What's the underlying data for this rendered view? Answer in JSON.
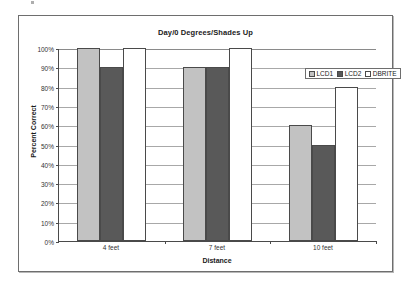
{
  "chart_data": {
    "type": "bar",
    "title": "Day/0 Degrees/Shades Up",
    "xlabel": "Distance",
    "ylabel": "Percent Correct",
    "categories": [
      "4 feet",
      "7 feet",
      "10 feet"
    ],
    "series": [
      {
        "name": "LCD1",
        "color": "#c2c2c2",
        "values": [
          100,
          90,
          60
        ]
      },
      {
        "name": "LCD2",
        "color": "#595959",
        "values": [
          90,
          90,
          50
        ]
      },
      {
        "name": "DBRITE",
        "color": "#ffffff",
        "values": [
          100,
          100,
          80
        ]
      }
    ],
    "ylim": [
      0,
      100
    ],
    "ytick_labels": [
      "100%",
      "90%",
      "80%",
      "70%",
      "60%",
      "50%",
      "40%",
      "30%",
      "20%",
      "10%",
      "0%"
    ],
    "ytick_values": [
      100,
      90,
      80,
      70,
      60,
      50,
      40,
      30,
      20,
      10,
      0
    ],
    "grid": true,
    "legend_position": "top-right",
    "value_suffix": "%"
  },
  "legend": {
    "entries": [
      {
        "label": "LCD1",
        "color": "#c2c2c2"
      },
      {
        "label": "LCD2",
        "color": "#595959"
      },
      {
        "label": "DBRITE",
        "color": "#ffffff"
      }
    ]
  }
}
